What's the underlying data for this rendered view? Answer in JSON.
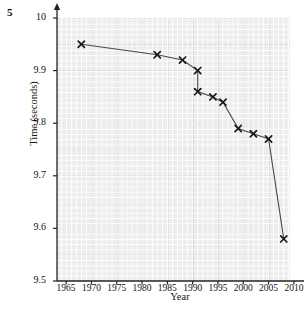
{
  "question_number": "5",
  "chart_data": {
    "type": "line",
    "title": "",
    "xlabel": "Year",
    "ylabel": "Time (seconds)",
    "xlim": [
      1963,
      2012
    ],
    "ylim": [
      9.5,
      10.0
    ],
    "xticks": [
      1965,
      1970,
      1975,
      1980,
      1985,
      1990,
      1995,
      2000,
      2005,
      2010
    ],
    "yticks": [
      "9.5",
      "9.6",
      "9.7",
      "9.8",
      "9.9",
      "10"
    ],
    "ytick_values": [
      9.5,
      9.6,
      9.7,
      9.8,
      9.9,
      10.0
    ],
    "grid": true,
    "grid_minor": true,
    "legend": "none",
    "marker": "x",
    "marker_color": "#1a1a1a",
    "line_color": "#4a4a4a",
    "grid_color": "#c9c6c6",
    "background": "#eeecec",
    "x": [
      1968,
      1983,
      1988,
      1991,
      1991,
      1994,
      1996,
      1999,
      2002,
      2005,
      2007,
      2009
    ],
    "values": [
      9.95,
      9.93,
      9.92,
      9.86,
      9.86,
      9.85,
      9.84,
      9.79,
      9.78,
      9.77,
      9.74,
      9.58
    ],
    "points": [
      {
        "x": 1968,
        "y": 9.95
      },
      {
        "x": 1983,
        "y": 9.93
      },
      {
        "x": 1988,
        "y": 9.92
      },
      {
        "x": 1991,
        "y": 9.9
      },
      {
        "x": 1991,
        "y": 9.86
      },
      {
        "x": 1994,
        "y": 9.85
      },
      {
        "x": 1996,
        "y": 9.84
      },
      {
        "x": 1999,
        "y": 9.79
      },
      {
        "x": 2002,
        "y": 9.78
      },
      {
        "x": 2005,
        "y": 9.77
      },
      {
        "x": 2008,
        "y": 9.58
      }
    ]
  }
}
